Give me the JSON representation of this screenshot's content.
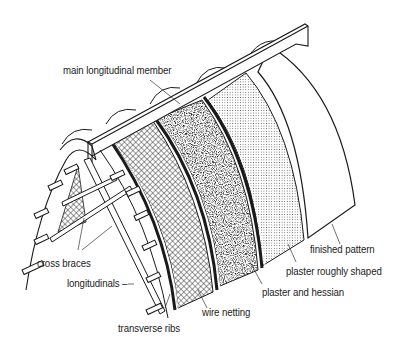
{
  "diagram": {
    "colors": {
      "line": "#1a1a1a",
      "background": "#ffffff"
    },
    "labels": [
      {
        "id": "main_longitudinal_member",
        "text": "main longitudinal member"
      },
      {
        "id": "cross_braces",
        "text": "cross braces"
      },
      {
        "id": "longitudinals",
        "text": "longitudinals –"
      },
      {
        "id": "transverse_ribs",
        "text": "transverse ribs"
      },
      {
        "id": "wire_netting",
        "text": "wire netting"
      },
      {
        "id": "plaster_and_hessian",
        "text": "plaster and hessian"
      },
      {
        "id": "plaster_roughly_shaped",
        "text": "plaster roughly shaped"
      },
      {
        "id": "finished_pattern",
        "text": "finished pattern"
      }
    ],
    "layers_order": [
      "transverse ribs",
      "longitudinals",
      "wire netting",
      "plaster and hessian",
      "plaster roughly shaped",
      "finished pattern"
    ]
  }
}
